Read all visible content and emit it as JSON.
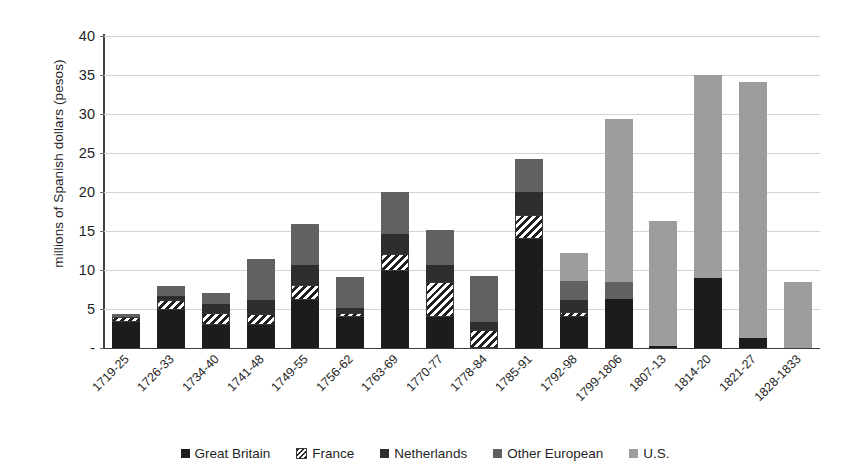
{
  "chart_data": {
    "type": "bar",
    "subtype": "stacked",
    "title": "",
    "xlabel": "",
    "ylabel": "millions of Spanish dollars (pesos)",
    "ylim": [
      0,
      40
    ],
    "ytick_values": [
      0,
      5,
      10,
      15,
      20,
      25,
      30,
      35,
      40
    ],
    "ytick_labels": [
      "-",
      "5",
      "10",
      "15",
      "20",
      "25",
      "30",
      "35",
      "40"
    ],
    "grid": "horizontal",
    "legend_position": "bottom",
    "categories": [
      "1719-25",
      "1726-33",
      "1734-40",
      "1741-48",
      "1749-55",
      "1756-62",
      "1763-69",
      "1770-77",
      "1778-84",
      "1785-91",
      "1792-98",
      "1799-1806",
      "1807-13",
      "1814-20",
      "1821-27",
      "1828-1833"
    ],
    "series": [
      {
        "name": "Great Britain",
        "color": "#1c1c1c",
        "pattern": "solid",
        "values": [
          3.3,
          4.9,
          3.0,
          2.9,
          6.2,
          4.0,
          9.9,
          4.0,
          0.0,
          14.0,
          4.0,
          6.3,
          0.3,
          9.0,
          1.3,
          0.0
        ]
      },
      {
        "name": "France",
        "color": "#ffffff",
        "pattern": "diagonal-hatch",
        "values": [
          0.7,
          1.2,
          1.5,
          1.4,
          1.9,
          0.5,
          2.1,
          4.5,
          2.3,
          3.1,
          0.6,
          0.0,
          0.0,
          0.0,
          0.0,
          0.0
        ]
      },
      {
        "name": "Netherlands",
        "color": "#2e2e2e",
        "pattern": "solid",
        "values": [
          0.0,
          0.6,
          1.1,
          1.9,
          2.6,
          0.6,
          2.6,
          2.1,
          1.0,
          2.9,
          1.6,
          0.0,
          0.0,
          0.0,
          0.0,
          0.0
        ]
      },
      {
        "name": "Other European",
        "color": "#616161",
        "pattern": "solid",
        "values": [
          0.4,
          1.2,
          1.5,
          5.2,
          5.2,
          4.0,
          5.4,
          4.5,
          5.9,
          4.2,
          2.4,
          2.2,
          0.0,
          0.0,
          0.0,
          0.0
        ]
      },
      {
        "name": "U.S.",
        "color": "#9d9d9d",
        "pattern": "solid",
        "values": [
          0.0,
          0.0,
          0.0,
          0.0,
          0.0,
          0.0,
          0.0,
          0.0,
          0.0,
          0.0,
          3.6,
          20.9,
          16.0,
          26.0,
          32.8,
          8.5
        ]
      }
    ],
    "totals": [
      4.4,
      7.9,
      7.1,
      11.4,
      15.9,
      9.1,
      20.0,
      15.1,
      9.2,
      24.2,
      12.2,
      29.4,
      16.3,
      35.0,
      34.1,
      8.5
    ]
  },
  "legend": {
    "items": [
      {
        "label": "Great Britain",
        "swatch": "gb-swatch-icon"
      },
      {
        "label": "France",
        "swatch": "france-swatch-icon"
      },
      {
        "label": "Netherlands",
        "swatch": "netherlands-swatch-icon"
      },
      {
        "label": "Other European",
        "swatch": "other-european-swatch-icon"
      },
      {
        "label": "U.S.",
        "swatch": "us-swatch-icon"
      }
    ]
  }
}
